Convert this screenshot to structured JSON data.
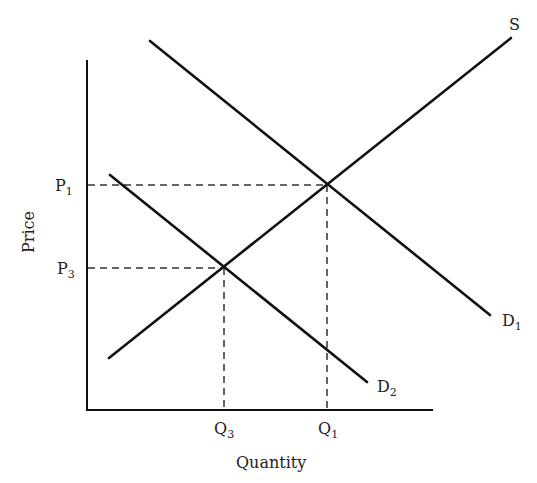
{
  "diagram": {
    "type": "supply-demand",
    "axes": {
      "x_label": "Quantity",
      "y_label": "Price"
    },
    "curves": {
      "supply": {
        "label": "S"
      },
      "demand_1": {
        "label": "D",
        "sub": "1"
      },
      "demand_2": {
        "label": "D",
        "sub": "2"
      }
    },
    "price_levels": [
      {
        "label": "P",
        "sub": "1"
      },
      {
        "label": "P",
        "sub": "3"
      }
    ],
    "quantity_levels": [
      {
        "label": "Q",
        "sub": "3"
      },
      {
        "label": "Q",
        "sub": "1"
      }
    ]
  },
  "colors": {
    "line": "#111111",
    "text": "#222222",
    "background": "#ffffff"
  }
}
